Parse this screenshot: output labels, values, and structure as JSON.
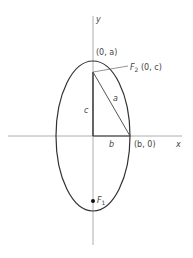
{
  "diagram": {
    "axes": {
      "x_label": "x",
      "y_label": "y"
    },
    "labels": {
      "top_vertex": "(0, a)",
      "focus2": "F",
      "focus2_sub": "2",
      "focus2_coords": " (0, c)",
      "focus1": "F",
      "focus1_sub": "1",
      "side_c": "c",
      "side_a": "a",
      "side_b": "b",
      "right_vertex": "(b, 0)"
    },
    "colors": {
      "stroke": "#333333",
      "axis": "#999999"
    }
  }
}
